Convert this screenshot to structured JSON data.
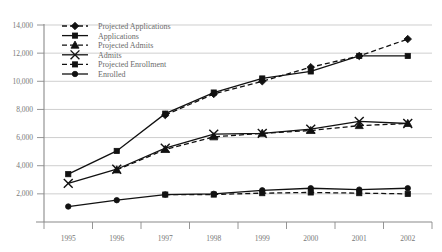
{
  "chart_data": {
    "type": "line",
    "title": "",
    "subtitle": "",
    "xlabel": "",
    "ylabel": "",
    "categories": [
      "1995",
      "1996",
      "1997",
      "1998",
      "1999",
      "2000",
      "2001",
      "2002"
    ],
    "x": [
      1995,
      1996,
      1997,
      1998,
      1999,
      2000,
      2001,
      2002
    ],
    "ylim": [
      0,
      14000
    ],
    "ytick_values": [
      2000,
      4000,
      6000,
      8000,
      10000,
      12000,
      14000
    ],
    "ytick_labels": [
      "2,000",
      "4,000",
      "6,000",
      "8,000",
      "10,000",
      "12,000",
      "14,000"
    ],
    "grid": true,
    "legend_position": "top-left",
    "series": [
      {
        "name": "Projected Applications",
        "marker": "diamond",
        "style": "dashed",
        "values": [
          null,
          null,
          7600,
          9100,
          10000,
          11000,
          11800,
          13000
        ]
      },
      {
        "name": "Applications",
        "marker": "square",
        "style": "solid",
        "values": [
          3400,
          5050,
          7700,
          9200,
          10200,
          10700,
          11800,
          11800
        ]
      },
      {
        "name": "Projected Admits",
        "marker": "triangle",
        "style": "dashed",
        "values": [
          null,
          3700,
          5150,
          6050,
          6300,
          6500,
          6850,
          7000
        ]
      },
      {
        "name": "Admits",
        "marker": "x",
        "style": "solid",
        "values": [
          2750,
          3750,
          5250,
          6250,
          6300,
          6600,
          7150,
          7000
        ]
      },
      {
        "name": "Projected Enrollment",
        "marker": "square",
        "style": "dashed",
        "values": [
          null,
          null,
          1950,
          1950,
          2050,
          2100,
          2050,
          2000
        ]
      },
      {
        "name": "Enrolled",
        "marker": "circle",
        "style": "solid",
        "values": [
          1100,
          1550,
          1950,
          2000,
          2250,
          2400,
          2300,
          2400
        ]
      }
    ]
  },
  "legend": {
    "items": [
      {
        "label": "Projected Applications"
      },
      {
        "label": "Applications"
      },
      {
        "label": "Projected Admits"
      },
      {
        "label": "Admits"
      },
      {
        "label": "Projected Enrollment"
      },
      {
        "label": "Enrolled"
      }
    ]
  },
  "colors": {
    "series": "#111111",
    "grid": "#b9b9b9",
    "axis": "#8a8a8a",
    "text": "#6b6b6b",
    "background": "#ffffff"
  }
}
